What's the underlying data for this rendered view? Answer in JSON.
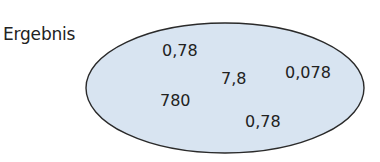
{
  "diagram": {
    "type": "set-ellipse",
    "label": "Ergebnis",
    "colors": {
      "fill": "#d8e4f1",
      "stroke": "#2a2a2a",
      "text": "#222222"
    },
    "elements": [
      {
        "value": "0,78"
      },
      {
        "value": "7,8"
      },
      {
        "value": "0,078"
      },
      {
        "value": "780"
      },
      {
        "value": "0,78"
      }
    ]
  }
}
